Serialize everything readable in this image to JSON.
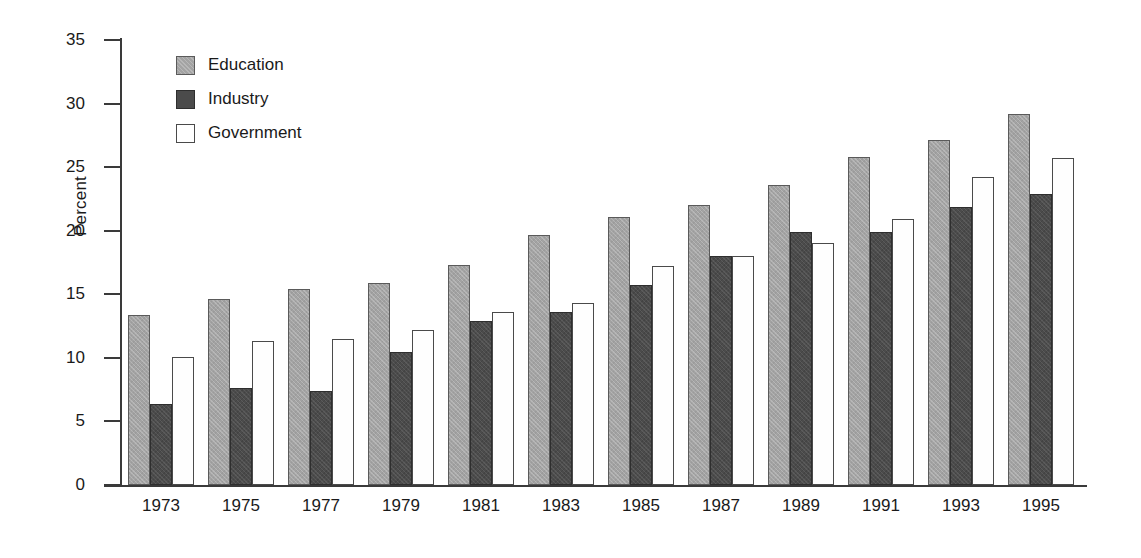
{
  "chart_data": {
    "type": "bar",
    "title": "",
    "xlabel": "",
    "ylabel": "Percent",
    "ylim": [
      0,
      35
    ],
    "yticks": [
      0,
      5,
      10,
      15,
      20,
      25,
      30,
      35
    ],
    "grid": false,
    "legend_position": "top-left",
    "categories": [
      "1973",
      "1975",
      "1977",
      "1979",
      "1981",
      "1983",
      "1985",
      "1987",
      "1989",
      "1991",
      "1993",
      "1995"
    ],
    "series": [
      {
        "name": "Education",
        "color": "#a3a3a3",
        "values": [
          13.4,
          14.6,
          15.4,
          15.9,
          17.3,
          19.7,
          21.1,
          22.0,
          23.6,
          25.8,
          27.1,
          29.2
        ]
      },
      {
        "name": "Industry",
        "color": "#4b4b4b",
        "values": [
          6.4,
          7.6,
          7.4,
          10.5,
          12.9,
          13.6,
          15.7,
          18.0,
          19.9,
          19.9,
          21.9,
          22.9
        ]
      },
      {
        "name": "Government",
        "color": "#ffffff",
        "values": [
          10.1,
          11.3,
          11.5,
          12.2,
          13.6,
          14.3,
          17.2,
          18.0,
          19.0,
          20.9,
          24.2,
          25.7
        ]
      }
    ]
  },
  "legend": {
    "items": [
      {
        "label": "Education",
        "key": "education"
      },
      {
        "label": "Industry",
        "key": "industry"
      },
      {
        "label": "Government",
        "key": "government"
      }
    ]
  }
}
